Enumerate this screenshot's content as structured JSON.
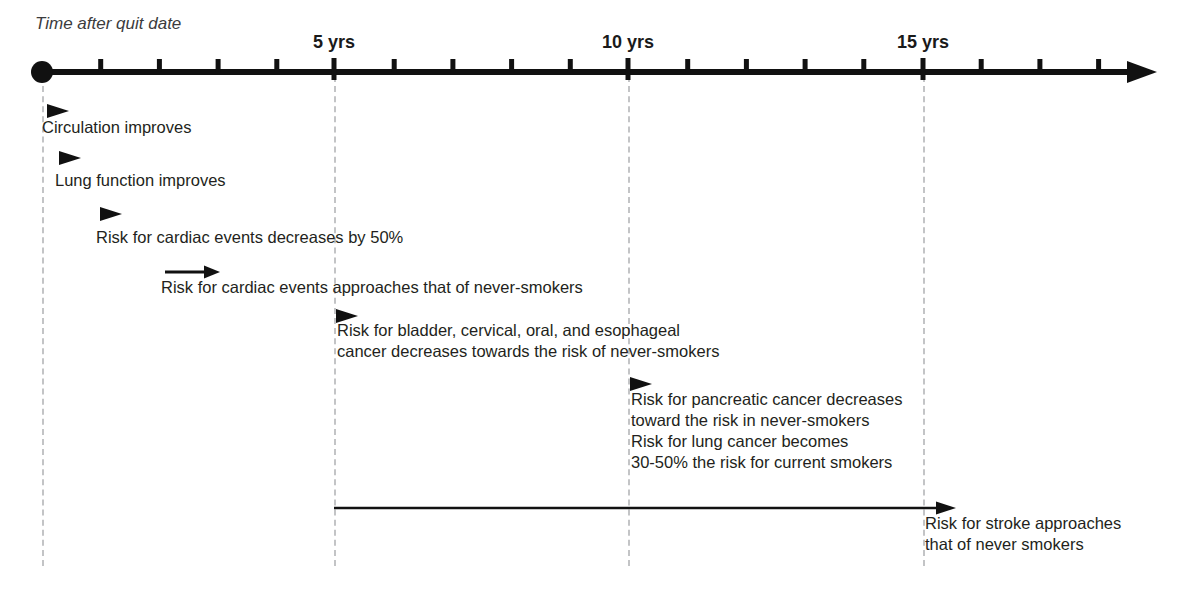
{
  "axis": {
    "caption": "Time after quit date",
    "tick_labels": [
      {
        "label": "5 yrs",
        "year": 5,
        "x": 334
      },
      {
        "label": "10 yrs",
        "year": 10,
        "x": 628
      },
      {
        "label": "15 yrs",
        "year": 15,
        "x": 923
      }
    ],
    "origin_x": 42,
    "axis_y": 72,
    "px_per_year": 58.7,
    "minor_tick_years": [
      1,
      2,
      3,
      4,
      6,
      7,
      8,
      9,
      11,
      12,
      13,
      14,
      16,
      17,
      18
    ],
    "arrow_end_x": 1157,
    "line_color": "#111111"
  },
  "gridlines": [
    {
      "name": "quit-date",
      "x": 42,
      "top": 76,
      "bottom": 566
    },
    {
      "name": "5-yrs",
      "x": 334,
      "top": 76,
      "bottom": 566
    },
    {
      "name": "10-yrs",
      "x": 628,
      "top": 76,
      "bottom": 566
    },
    {
      "name": "15-yrs",
      "x": 923,
      "top": 76,
      "bottom": 566
    }
  ],
  "events": [
    {
      "id": "circulation",
      "text": "Circulation improves",
      "marker": "triangle",
      "marker_x": 47,
      "marker_y": 100,
      "text_x": 42,
      "text_y": 117
    },
    {
      "id": "lung-function",
      "text": "Lung function improves",
      "marker": "triangle",
      "marker_x": 59,
      "marker_y": 147,
      "text_x": 55,
      "text_y": 170
    },
    {
      "id": "cardiac-50-percent",
      "text": "Risk for cardiac events decreases by 50%",
      "marker": "triangle",
      "marker_x": 100,
      "marker_y": 203,
      "text_x": 96,
      "text_y": 227
    },
    {
      "id": "cardiac-never-smokers",
      "text": "Risk for cardiac events approaches that of never-smokers",
      "marker": "arrow",
      "marker_x": 165,
      "marker_y": 261,
      "marker_width": 55,
      "text_x": 161,
      "text_y": 277
    },
    {
      "id": "bladder-cervical-oral-esophageal",
      "text": "Risk for bladder, cervical, oral, and esophageal\ncancer decreases towards the risk of never-smokers",
      "marker": "triangle",
      "marker_x": 336,
      "marker_y": 305,
      "text_x": 337,
      "text_y": 320
    },
    {
      "id": "pancreatic-and-lung",
      "text": "Risk for pancreatic cancer decreases\ntoward the risk in never-smokers\nRisk for lung cancer becomes\n30-50% the risk for current smokers",
      "marker": "triangle",
      "marker_x": 630,
      "marker_y": 373,
      "text_x": 631,
      "text_y": 389
    },
    {
      "id": "stroke",
      "text": "Risk for stroke approaches\nthat of never smokers",
      "marker": "long-arrow",
      "marker_x": 334,
      "marker_y": 497,
      "marker_width": 622,
      "text_x": 925,
      "text_y": 513
    }
  ]
}
